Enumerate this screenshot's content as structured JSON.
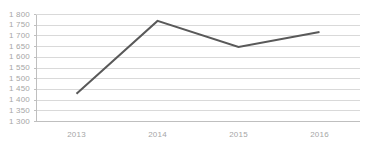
{
  "chart_data": {
    "type": "line",
    "title": "",
    "subtitle": "",
    "xlabel": "",
    "ylabel": "",
    "categories": [
      "2013",
      "2014",
      "2015",
      "2016"
    ],
    "values": [
      1430,
      1770,
      1648,
      1718
    ],
    "series": [
      {
        "name": "",
        "values": [
          1430,
          1770,
          1648,
          1718
        ],
        "color": "#595959"
      }
    ],
    "ylim": [
      1300,
      1800
    ],
    "ytick_step": 50,
    "ytick_labels": [
      "1 800",
      "1 750",
      "1 700",
      "1 650",
      "1 600",
      "1 550",
      "1 500",
      "1 450",
      "1 400",
      "1 350",
      "1 300"
    ],
    "ytick_values": [
      1800,
      1750,
      1700,
      1650,
      1600,
      1550,
      1500,
      1450,
      1400,
      1350,
      1300
    ],
    "xtick_labels": [
      "2013",
      "2014",
      "2015",
      "2016"
    ],
    "grid": {
      "horizontal": true,
      "vertical": false,
      "color": "#d9d9d9"
    },
    "legend": {
      "visible": false,
      "position": "none",
      "entries": []
    },
    "markers": false,
    "line_width": 2,
    "colors": {
      "line": "#595959",
      "grid": "#d9d9d9",
      "axis": "#bfbfbf",
      "tick_text": "#a6a6a6",
      "background": "#ffffff"
    }
  }
}
